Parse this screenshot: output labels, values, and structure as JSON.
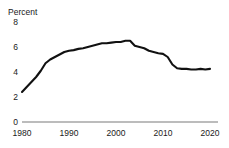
{
  "figure": {
    "top_partial_text": "",
    "y_axis_label": "Percent"
  },
  "axis": {
    "y_ticks": [
      "8",
      "6",
      "4",
      "2",
      "0"
    ],
    "x_ticks": [
      "1980",
      "1990",
      "2000",
      "2010",
      "2020"
    ],
    "axis_line_color": "#a6a6a6",
    "line_color": "#111111"
  },
  "chart_data": {
    "type": "line",
    "title": "",
    "subtitle": "",
    "xlabel": "",
    "ylabel": "Percent",
    "xlim": [
      1980,
      2020
    ],
    "ylim": [
      0,
      8
    ],
    "ytick_values": [
      0,
      2,
      4,
      6,
      8
    ],
    "xtick_values": [
      1980,
      1990,
      2000,
      2010,
      2020
    ],
    "grid": false,
    "legend": null,
    "legend_position": "none",
    "annotations": [],
    "series": [
      {
        "name": "Percent",
        "color": "#111111",
        "x": [
          1980,
          1981,
          1982,
          1983,
          1984,
          1985,
          1986,
          1987,
          1988,
          1989,
          1990,
          1991,
          1992,
          1993,
          1994,
          1995,
          1996,
          1997,
          1998,
          1999,
          2000,
          2001,
          2002,
          2003,
          2004,
          2005,
          2006,
          2007,
          2008,
          2009,
          2010,
          2011,
          2012,
          2013,
          2014,
          2015,
          2016,
          2017,
          2018,
          2019,
          2020
        ],
        "values": [
          2.4,
          2.8,
          3.2,
          3.6,
          4.1,
          4.7,
          5.0,
          5.2,
          5.4,
          5.6,
          5.7,
          5.75,
          5.85,
          5.9,
          6.0,
          6.1,
          6.2,
          6.3,
          6.3,
          6.35,
          6.4,
          6.4,
          6.5,
          6.5,
          6.1,
          6.0,
          5.9,
          5.7,
          5.6,
          5.5,
          5.45,
          5.2,
          4.6,
          4.3,
          4.25,
          4.25,
          4.2,
          4.2,
          4.25,
          4.2,
          4.25
        ]
      }
    ]
  }
}
